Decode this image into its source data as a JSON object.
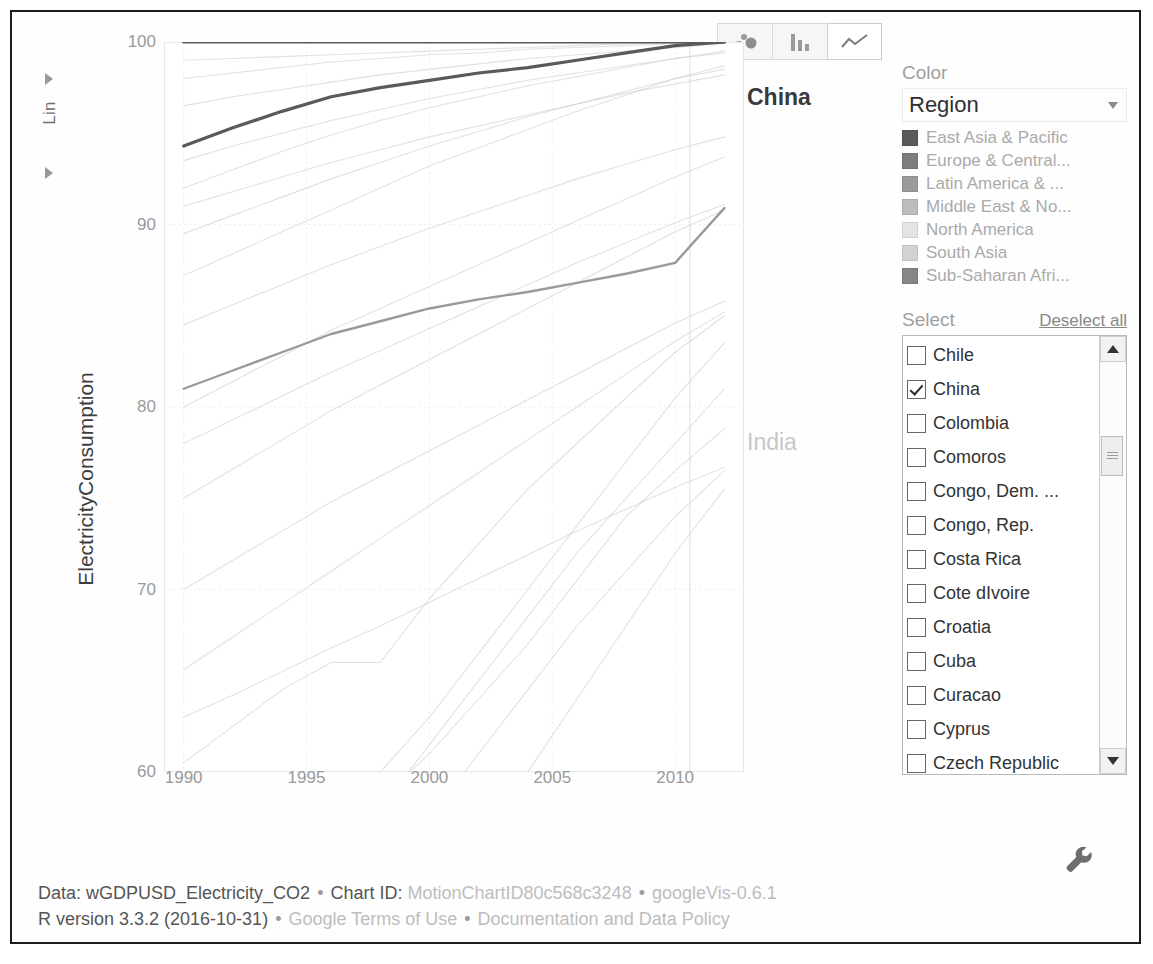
{
  "toolbar": {
    "buttons": [
      {
        "name": "bubble-chart",
        "label": "Bubble chart",
        "active": false
      },
      {
        "name": "bar-chart",
        "label": "Bar chart",
        "active": false
      },
      {
        "name": "line-chart",
        "label": "Line chart",
        "active": true
      }
    ]
  },
  "yscale": {
    "mode": "Lin"
  },
  "color_panel": {
    "heading": "Color",
    "selected": "Region",
    "legend": [
      {
        "label": "East Asia & Pacific",
        "color": "#5a5a5a"
      },
      {
        "label": "Europe & Central...",
        "color": "#7d7d7d"
      },
      {
        "label": "Latin America & ...",
        "color": "#9b9b9b"
      },
      {
        "label": "Middle East & No...",
        "color": "#bcbcbc"
      },
      {
        "label": "North America",
        "color": "#e4e4e4"
      },
      {
        "label": "South Asia",
        "color": "#d2d2d2"
      },
      {
        "label": "Sub-Saharan Afri...",
        "color": "#868686"
      }
    ]
  },
  "select_panel": {
    "heading": "Select",
    "deselect_all": "Deselect all",
    "countries": [
      {
        "name": "Chile",
        "checked": false
      },
      {
        "name": "China",
        "checked": true
      },
      {
        "name": "Colombia",
        "checked": false
      },
      {
        "name": "Comoros",
        "checked": false
      },
      {
        "name": "Congo, Dem. ...",
        "checked": false
      },
      {
        "name": "Congo, Rep.",
        "checked": false
      },
      {
        "name": "Costa Rica",
        "checked": false
      },
      {
        "name": "Cote dIvoire",
        "checked": false
      },
      {
        "name": "Croatia",
        "checked": false
      },
      {
        "name": "Cuba",
        "checked": false
      },
      {
        "name": "Curacao",
        "checked": false
      },
      {
        "name": "Cyprus",
        "checked": false
      },
      {
        "name": "Czech Republic",
        "checked": false
      }
    ]
  },
  "footer": {
    "line1": {
      "data_label": "Data:",
      "data_value": "wGDPUSD_Electricity_CO2",
      "chartid_label": "Chart ID:",
      "chartid_value": "MotionChartID80c568c3248",
      "version": "googleVis-0.6.1"
    },
    "line2": {
      "r_version": "R version 3.3.2 (2016-10-31)",
      "terms": "Google Terms of Use",
      "docs": "Documentation and Data Policy"
    },
    "separator": "•"
  },
  "chart_data": {
    "type": "line",
    "title": "",
    "xlabel": "",
    "ylabel": "ElectricityConsumption",
    "xlim": [
      1989.2,
      1989.2
    ],
    "ylim": [
      60,
      100
    ],
    "xticks": [
      1990,
      1995,
      2000,
      2005,
      2010
    ],
    "yticks": [
      60,
      70,
      80,
      90,
      100
    ],
    "grid": true,
    "x": [
      1990,
      1992,
      1994,
      1996,
      1998,
      2000,
      2002,
      2004,
      2006,
      2008,
      2010,
      2012
    ],
    "highlighted_labels": [
      {
        "text": "China",
        "style": "bold-dark"
      },
      {
        "text": "India",
        "style": "light-gray"
      }
    ],
    "series": [
      {
        "name": "ceiling-100",
        "values": [
          100,
          100,
          100,
          100,
          100,
          100,
          100,
          100,
          100,
          100,
          100,
          100
        ],
        "emphasis": "strong"
      },
      {
        "name": "China",
        "values": [
          94.3,
          95.3,
          96.2,
          97.0,
          97.5,
          97.9,
          98.3,
          98.6,
          99.0,
          99.4,
          99.8,
          100.0
        ],
        "emphasis": "strong"
      },
      {
        "name": "secondary-rising",
        "values": [
          81.0,
          82.0,
          83.0,
          84.0,
          84.7,
          85.4,
          85.9,
          86.3,
          86.8,
          87.3,
          87.9,
          90.9
        ],
        "emphasis": "medium"
      },
      {
        "name": "India",
        "values": [
          50.5,
          52.5,
          54.5,
          56.5,
          58.5,
          61.0,
          64.0,
          67.0,
          70.5,
          74.0,
          76.5,
          78.8
        ],
        "emphasis": "faint"
      },
      {
        "name": "bg-a",
        "values": [
          87.2,
          88.4,
          89.6,
          90.8,
          92.0,
          93.2,
          94.2,
          95.2,
          96.2,
          97.1,
          98.0,
          98.7
        ],
        "emphasis": "faint"
      },
      {
        "name": "bg-b",
        "values": [
          80.0,
          81.4,
          82.8,
          84.2,
          85.4,
          86.6,
          87.8,
          89.0,
          90.2,
          91.4,
          92.6,
          93.7
        ],
        "emphasis": "faint"
      },
      {
        "name": "bg-c",
        "values": [
          65.6,
          67.4,
          69.2,
          71.0,
          72.8,
          74.6,
          76.4,
          78.2,
          80.0,
          81.8,
          83.6,
          85.2
        ],
        "emphasis": "faint"
      },
      {
        "name": "bg-d",
        "values": [
          92.0,
          93.0,
          94.0,
          94.9,
          95.7,
          96.4,
          97.0,
          97.6,
          98.1,
          98.6,
          99.1,
          99.5
        ],
        "emphasis": "faint"
      },
      {
        "name": "bg-e",
        "values": [
          96.5,
          97.0,
          97.4,
          97.8,
          98.2,
          98.5,
          98.8,
          99.1,
          99.3,
          99.5,
          99.7,
          99.9
        ],
        "emphasis": "faint"
      },
      {
        "name": "bg-f",
        "values": [
          75.0,
          76.6,
          78.2,
          79.8,
          81.2,
          82.6,
          84.0,
          85.4,
          86.8,
          88.2,
          89.6,
          90.8
        ],
        "emphasis": "faint"
      },
      {
        "name": "bg-g",
        "values": [
          55.0,
          56.0,
          57.5,
          59.2,
          60.0,
          63.0,
          66.5,
          70.0,
          73.5,
          77.0,
          80.5,
          83.5
        ],
        "emphasis": "faint"
      },
      {
        "name": "bg-h",
        "values": [
          44.0,
          46.0,
          48.5,
          51.0,
          54.0,
          57.5,
          61.0,
          64.5,
          68.0,
          71.0,
          74.0,
          76.5
        ],
        "emphasis": "faint"
      },
      {
        "name": "bg-i",
        "values": [
          89.5,
          90.5,
          91.5,
          92.5,
          93.4,
          94.3,
          95.1,
          95.9,
          96.6,
          97.3,
          98.0,
          98.5
        ],
        "emphasis": "faint"
      },
      {
        "name": "bg-j",
        "values": [
          70.0,
          71.6,
          73.2,
          74.8,
          76.2,
          77.6,
          79.0,
          80.4,
          81.8,
          83.2,
          84.6,
          85.8
        ],
        "emphasis": "faint"
      },
      {
        "name": "bg-k",
        "values": [
          60.5,
          62.5,
          64.5,
          66.0,
          66.0,
          69.5,
          72.5,
          75.5,
          78.0,
          80.5,
          83.0,
          85.0
        ],
        "emphasis": "faint"
      },
      {
        "name": "bg-l",
        "values": [
          98.0,
          98.3,
          98.6,
          98.9,
          99.1,
          99.3,
          99.4,
          99.6,
          99.7,
          99.8,
          99.9,
          100.0
        ],
        "emphasis": "faint"
      },
      {
        "name": "bg-m",
        "values": [
          84.5,
          85.6,
          86.7,
          87.8,
          88.8,
          89.8,
          90.7,
          91.6,
          92.5,
          93.3,
          94.1,
          94.8
        ],
        "emphasis": "faint"
      },
      {
        "name": "bg-n",
        "values": [
          38.0,
          40.5,
          43.0,
          46.0,
          49.0,
          52.5,
          56.0,
          60.0,
          64.0,
          68.0,
          72.0,
          75.5
        ],
        "emphasis": "faint"
      },
      {
        "name": "bg-o",
        "values": [
          93.5,
          94.3,
          95.0,
          95.7,
          96.3,
          96.9,
          97.4,
          97.9,
          98.3,
          98.7,
          99.1,
          99.4
        ],
        "emphasis": "faint"
      },
      {
        "name": "bg-p",
        "values": [
          78.0,
          79.3,
          80.6,
          81.9,
          83.1,
          84.3,
          85.5,
          86.7,
          87.9,
          89.0,
          90.1,
          91.1
        ],
        "emphasis": "faint"
      },
      {
        "name": "bg-q",
        "values": [
          63.0,
          64.2,
          65.5,
          66.8,
          68.0,
          69.3,
          70.6,
          71.9,
          73.2,
          74.4,
          75.6,
          76.7
        ],
        "emphasis": "faint"
      },
      {
        "name": "bg-r",
        "values": [
          99.0,
          99.1,
          99.2,
          99.3,
          99.4,
          99.5,
          99.6,
          99.7,
          99.8,
          99.9,
          99.95,
          100.0
        ],
        "emphasis": "faint"
      },
      {
        "name": "bg-s",
        "values": [
          91.0,
          91.8,
          92.6,
          93.4,
          94.1,
          94.8,
          95.4,
          96.0,
          96.6,
          97.2,
          97.7,
          98.2
        ],
        "emphasis": "faint"
      },
      {
        "name": "bg-t",
        "values": [
          47.0,
          49.5,
          52.0,
          55.0,
          58.0,
          61.5,
          65.0,
          68.5,
          72.0,
          75.0,
          78.0,
          81.0
        ],
        "emphasis": "faint"
      }
    ]
  }
}
